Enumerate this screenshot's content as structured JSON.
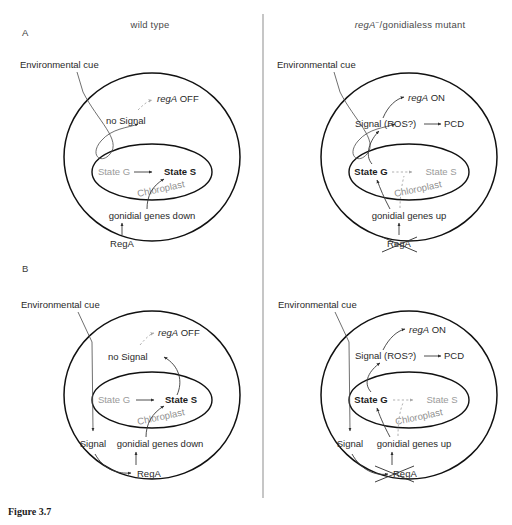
{
  "figure": {
    "caption": "Figure 3.7",
    "column_titles": {
      "left": "wild type",
      "right_gene": "regA",
      "right_sup": "−",
      "right_rest": "/gonidialess mutant"
    },
    "panel_labels": {
      "a": "A",
      "b": "B"
    }
  },
  "panels": {
    "a_wildtype": {
      "env_cue": "Environmental cue",
      "rega_state": "regA OFF",
      "rega_gene": "regA",
      "rega_suffix": " OFF",
      "signal": "no Signal",
      "state_g": "State G",
      "state_s": "State S",
      "chloroplast": "Chloroplast",
      "genes": "gonidial genes down",
      "rega_protein": "RegA",
      "rega_crossed": false,
      "state_g_active": false,
      "state_s_active": true
    },
    "a_mutant": {
      "env_cue": "Environmental cue",
      "rega_state": "regA ON",
      "rega_gene": "regA",
      "rega_suffix": " ON",
      "signal": "Signal (ROS?)",
      "pcd": "PCD",
      "state_g": "State G",
      "state_s": "State S",
      "chloroplast": "Chloroplast",
      "genes": "gonidial genes up",
      "rega_protein": "RegA",
      "rega_crossed": true,
      "state_g_active": true,
      "state_s_active": false
    },
    "b_wildtype": {
      "env_cue": "Environmental cue",
      "rega_state": "regA OFF",
      "rega_gene": "regA",
      "rega_suffix": " OFF",
      "signal_inner": "no Signal",
      "signal_outer": "Signal",
      "state_g": "State G",
      "state_s": "State S",
      "chloroplast": "Chloroplast",
      "genes": "gonidial genes down",
      "rega_protein": "RegA",
      "rega_crossed": false,
      "state_g_active": false,
      "state_s_active": true
    },
    "b_mutant": {
      "env_cue": "Environmental cue",
      "rega_state": "regA ON",
      "rega_gene": "regA",
      "rega_suffix": " ON",
      "signal_inner": "Signal (ROS?)",
      "signal_outer": "Signal",
      "pcd": "PCD",
      "state_g": "State G",
      "state_s": "State S",
      "chloroplast": "Chloroplast",
      "genes": "gonidial genes up",
      "rega_protein": "RegA",
      "rega_crossed": true,
      "state_g_active": true,
      "state_s_active": false
    }
  },
  "colors": {
    "ink": "#1b1b1b",
    "muted": "#9a9a9a",
    "line": "#3a3a3a",
    "dashed": "#a8a8a8",
    "divider": "#8d8d8d",
    "background": "#ffffff"
  }
}
